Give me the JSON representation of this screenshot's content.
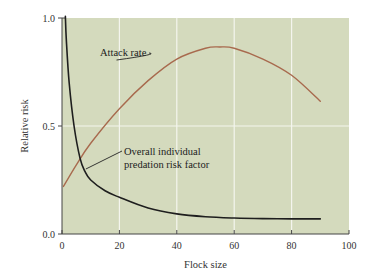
{
  "chart_data": {
    "type": "line",
    "title": "",
    "xlabel": "Flock size",
    "ylabel": "Relative risk",
    "xlim": [
      0,
      100
    ],
    "ylim": [
      0,
      1.0
    ],
    "x_ticks": [
      0,
      20,
      40,
      60,
      80,
      100
    ],
    "x_tick_labels": [
      "0",
      "20",
      "40",
      "60",
      "80",
      "100"
    ],
    "y_ticks": [
      0,
      0.5,
      1.0
    ],
    "y_tick_labels": [
      "0.0",
      "0.5",
      "1.0"
    ],
    "grid": {
      "x": [
        20,
        40,
        60,
        80
      ],
      "y": [
        0.5
      ]
    },
    "legend": "none (inline annotations)",
    "colors": {
      "plot_background": "#d4dabd",
      "grid": "#f4f5ee",
      "attack_rate": "#a86a4e",
      "risk_factor": "#1e1e1e",
      "axis": "#444444"
    },
    "series": [
      {
        "name": "Attack rate",
        "x": [
          0.5,
          5,
          10,
          20,
          30,
          40,
          50,
          55,
          60,
          70,
          80,
          90
        ],
        "y": [
          0.22,
          0.32,
          0.42,
          0.58,
          0.71,
          0.81,
          0.86,
          0.866,
          0.86,
          0.81,
          0.735,
          0.615
        ]
      },
      {
        "name": "Overall individual predation risk factor",
        "x": [
          1.2,
          1.5,
          2.5,
          4.2,
          6.3,
          8,
          10,
          15,
          20,
          30,
          40,
          50,
          60,
          70,
          80,
          90
        ],
        "y": [
          1.0,
          0.9,
          0.7,
          0.5,
          0.35,
          0.29,
          0.25,
          0.2,
          0.17,
          0.12,
          0.093,
          0.08,
          0.074,
          0.071,
          0.07,
          0.07
        ]
      }
    ],
    "annotations": [
      {
        "text": "Attack rate",
        "target_series": "Attack rate",
        "at_x": 19,
        "at_y": 0.8
      },
      {
        "lines": [
          "Overall individual",
          "predation risk factor"
        ],
        "target_series": "Overall individual predation risk factor",
        "at_x": 21,
        "at_y": 0.38
      }
    ]
  }
}
